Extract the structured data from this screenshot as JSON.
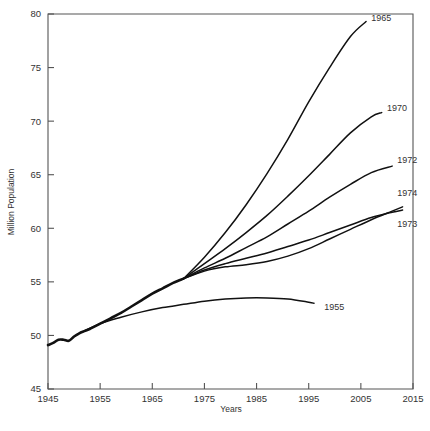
{
  "chart_data": {
    "type": "line",
    "title": "",
    "xlabel": "Years",
    "ylabel": "Million Population",
    "xlim": [
      1945,
      2015
    ],
    "ylim": [
      45,
      80
    ],
    "xticks": [
      1945,
      1955,
      1965,
      1975,
      1985,
      1995,
      2005,
      2015
    ],
    "yticks": [
      45,
      50,
      55,
      60,
      65,
      70,
      75,
      80
    ],
    "xtick_labels": [
      "1945",
      "1955",
      "1965",
      "1975",
      "1985",
      "1995",
      "2005",
      "2015"
    ],
    "ytick_labels": [
      "45",
      "50",
      "55",
      "60",
      "65",
      "70",
      "75",
      "80"
    ],
    "grid": false,
    "legend": "inline-end-labels",
    "trunk": {
      "name": "common-history",
      "x": [
        1945,
        1946,
        1947,
        1948,
        1949,
        1950,
        1951,
        1952,
        1953,
        1955,
        1957,
        1959,
        1961,
        1963,
        1965,
        1967,
        1969,
        1971
      ],
      "values": [
        49.1,
        49.3,
        49.6,
        49.6,
        49.5,
        49.9,
        50.2,
        50.4,
        50.6,
        51.1,
        51.6,
        52.1,
        52.7,
        53.3,
        53.9,
        54.4,
        54.9,
        55.3
      ]
    },
    "series": [
      {
        "name": "1965",
        "label": "1965",
        "x": [
          1971,
          1975,
          1979,
          1983,
          1987,
          1991,
          1995,
          1999,
          2003,
          2006
        ],
        "values": [
          55.3,
          57.3,
          59.6,
          62.2,
          65.1,
          68.3,
          71.8,
          75.0,
          77.9,
          79.3
        ],
        "label_pos": {
          "x": 2007,
          "y": 79.6
        }
      },
      {
        "name": "1970",
        "label": "1970",
        "x": [
          1971,
          1975,
          1979,
          1983,
          1987,
          1991,
          1995,
          1999,
          2003,
          2007,
          2009
        ],
        "values": [
          55.3,
          56.7,
          58.1,
          59.6,
          61.2,
          63.0,
          64.9,
          66.9,
          68.9,
          70.4,
          70.8
        ],
        "label_pos": {
          "x": 2010,
          "y": 71.2
        }
      },
      {
        "name": "1972",
        "label": "1972",
        "x": [
          1971,
          1975,
          1979,
          1983,
          1987,
          1991,
          1995,
          1999,
          2003,
          2007,
          2011
        ],
        "values": [
          55.3,
          56.3,
          57.2,
          58.2,
          59.2,
          60.4,
          61.6,
          62.9,
          64.1,
          65.2,
          65.8
        ],
        "label_pos": {
          "x": 2012,
          "y": 66.4
        }
      },
      {
        "name": "1974",
        "label": "1974",
        "x": [
          1971,
          1975,
          1979,
          1983,
          1987,
          1991,
          1995,
          1999,
          2003,
          2007,
          2011,
          2013
        ],
        "values": [
          55.3,
          56.0,
          56.4,
          56.6,
          56.9,
          57.4,
          58.1,
          59.0,
          59.9,
          60.8,
          61.6,
          62.0
        ],
        "label_pos": {
          "x": 2012,
          "y": 63.3
        }
      },
      {
        "name": "1973",
        "label": "1973",
        "x": [
          1971,
          1975,
          1979,
          1983,
          1987,
          1991,
          1995,
          1999,
          2003,
          2007,
          2011,
          2013
        ],
        "values": [
          55.3,
          56.1,
          56.7,
          57.2,
          57.7,
          58.3,
          58.9,
          59.6,
          60.3,
          61.0,
          61.5,
          61.7
        ],
        "label_pos": {
          "x": 2012,
          "y": 60.4
        }
      },
      {
        "name": "1955",
        "label": "1955",
        "x": [
          1951,
          1955,
          1959,
          1963,
          1967,
          1971,
          1975,
          1979,
          1983,
          1987,
          1991,
          1995,
          1996
        ],
        "values": [
          50.2,
          51.1,
          51.7,
          52.2,
          52.6,
          52.9,
          53.2,
          53.4,
          53.5,
          53.5,
          53.4,
          53.1,
          53.0
        ],
        "label_pos": {
          "x": 1998,
          "y": 52.7
        }
      }
    ]
  }
}
